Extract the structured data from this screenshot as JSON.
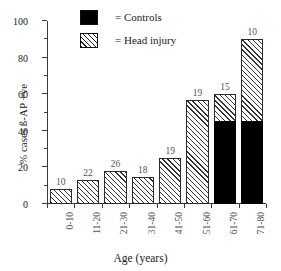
{
  "chart_data": {
    "type": "bar",
    "title": "",
    "subtitle": "",
    "xlabel": "Age (years)",
    "ylabel": "% cases ß-AP +ve",
    "categories": [
      "0-10",
      "11-20",
      "21-30",
      "31-40",
      "41-50",
      "51-60",
      "61-70",
      "71-80"
    ],
    "ylim": [
      0,
      100
    ],
    "ytick_labels": [
      "0",
      "20",
      "40",
      "60",
      "80",
      "100"
    ],
    "ytick_values": [
      0,
      20,
      40,
      60,
      80,
      100
    ],
    "yminor_values": [
      10,
      30,
      50,
      70,
      90
    ],
    "grid": false,
    "stacked": true,
    "legend_position": "top-center",
    "series": [
      {
        "name": "Controls",
        "fill": "solid-black",
        "color": "#000000",
        "values": [
          0,
          0,
          0,
          0,
          0,
          0,
          45.5,
          45.5
        ]
      },
      {
        "name": "Head injury",
        "fill": "diagonal-hatch",
        "color": "#ffffff",
        "values": [
          8,
          13,
          18,
          15,
          25,
          57,
          60,
          90
        ]
      }
    ],
    "bar_total_heights": [
      8,
      13,
      18,
      15,
      25,
      57,
      60,
      90
    ],
    "annotations": {
      "label": "n per age group, printed above each bar",
      "values": [
        "10",
        "22",
        "26",
        "18",
        "19",
        "19",
        "15",
        "10"
      ]
    }
  },
  "legend": {
    "items": [
      {
        "label": "= Controls",
        "swatch": "solid-black-square"
      },
      {
        "label": "= Head injury",
        "swatch": "hatched-square"
      }
    ]
  }
}
